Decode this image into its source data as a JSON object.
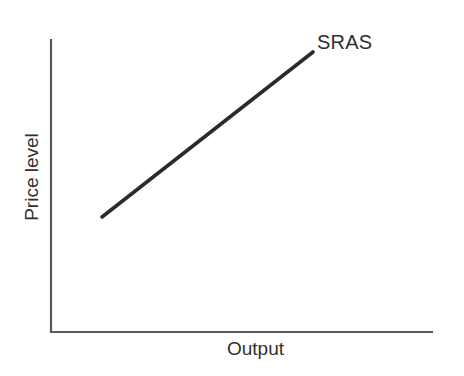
{
  "figure": {
    "width": 464,
    "height": 376,
    "background_color": "#ffffff",
    "axis_color": "#5a5a5a",
    "curve_color": "#2b2b2b",
    "text_color": "#2f2f2f"
  },
  "chart_data": {
    "type": "line",
    "title": "",
    "subtitle": "",
    "xlabel": "Output",
    "ylabel": "Price level",
    "xlim": [
      0,
      100
    ],
    "ylim": [
      0,
      100
    ],
    "grid": false,
    "xticks": [],
    "yticks": [],
    "xticklabels": [],
    "yticklabels": [],
    "legend": false,
    "legend_position": "none",
    "series": [
      {
        "name": "SRAS",
        "label": "SRAS",
        "label_position": "end-above-right",
        "x": [
          13.4,
          68.8
        ],
        "y": [
          39.4,
          96.0
        ],
        "style": "solid-straight-upward-sloping",
        "color": "#2b2b2b"
      }
    ],
    "annotations": [
      {
        "text": "SRAS",
        "x": 70.0,
        "y": 99.0
      }
    ]
  },
  "geometry": {
    "y_axis": {
      "x": 51,
      "y_top": 40,
      "y_bottom": 332
    },
    "x_axis": {
      "y": 332,
      "x_left": 51,
      "x_right": 432
    },
    "sras_line": {
      "x1": 102,
      "y1": 217,
      "x2": 313,
      "y2": 52
    }
  },
  "labels": {
    "curve": "SRAS",
    "x_axis": "Output",
    "y_axis": "Price level"
  }
}
